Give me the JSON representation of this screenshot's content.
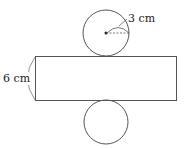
{
  "diagram": {
    "type": "cylinder-net",
    "radius_label": "3 cm",
    "height_label": "6 cm",
    "colors": {
      "stroke": "#555555",
      "text": "#222222"
    }
  }
}
